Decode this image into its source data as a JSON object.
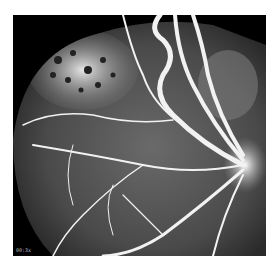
{
  "image": {
    "subject": "fluorescein angiogram of retina",
    "overlay_label": "00:3x",
    "colors": {
      "background": "#000000",
      "border": "#ffffff",
      "vessel": "#f2f2f2",
      "leakage": "#d8d8d8"
    }
  }
}
